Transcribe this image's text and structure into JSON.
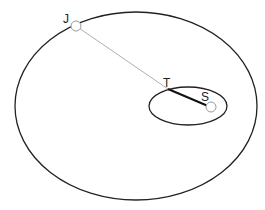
{
  "diagram": {
    "labels": {
      "J": "J",
      "T": "T",
      "S": "S"
    },
    "colors": {
      "orbit_stroke": "#222222",
      "J_T_line": "#b0b0b0",
      "T_S_line": "#111111",
      "body_stroke": "#999999",
      "body_fill": "#ffffff"
    },
    "large_orbit": {
      "cx": 136,
      "cy": 106,
      "rx": 121,
      "ry": 94
    },
    "small_orbit": {
      "cx": 188,
      "cy": 106,
      "rx": 39,
      "ry": 19
    },
    "points": {
      "J": {
        "x": 76,
        "y": 26,
        "r": 5
      },
      "T": {
        "x": 168,
        "y": 89
      },
      "S": {
        "x": 211,
        "y": 107,
        "r": 5
      }
    }
  }
}
